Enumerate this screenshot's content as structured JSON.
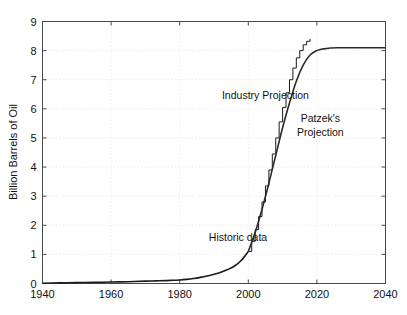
{
  "chart_data": {
    "type": "line",
    "title": "",
    "xlabel": "",
    "ylabel": "Billion Barrels of Oil",
    "xlim": [
      1940,
      2040
    ],
    "ylim": [
      0,
      9
    ],
    "xticks": [
      1940,
      1960,
      1980,
      2000,
      2020,
      2040
    ],
    "yticks": [
      0,
      1,
      2,
      3,
      4,
      5,
      6,
      7,
      8,
      9
    ],
    "grid": true,
    "grid_style": "dotted",
    "legend_position": "none",
    "annotations": [
      {
        "text": "Industry Projection",
        "x": 2005,
        "y": 6.35
      },
      {
        "text": "Patzek's",
        "x": 2021,
        "y": 5.55
      },
      {
        "text": "Projection",
        "x": 2021,
        "y": 5.05
      },
      {
        "text": "Historic data",
        "x": 1997,
        "y": 1.45
      }
    ],
    "series": [
      {
        "name": "Historic data",
        "style": "smooth",
        "color": "#1a1a1a",
        "width": 1.6,
        "x": [
          1940,
          1945,
          1950,
          1955,
          1960,
          1965,
          1970,
          1973,
          1976,
          1978,
          1980,
          1982,
          1984,
          1986,
          1988,
          1990,
          1992,
          1994,
          1996,
          1998,
          2000
        ],
        "values": [
          0.01,
          0.02,
          0.03,
          0.04,
          0.05,
          0.06,
          0.08,
          0.09,
          0.1,
          0.11,
          0.12,
          0.14,
          0.17,
          0.21,
          0.26,
          0.32,
          0.39,
          0.48,
          0.6,
          0.8,
          1.1
        ]
      },
      {
        "name": "Industry Projection",
        "style": "staircase",
        "color": "#1a1a1a",
        "width": 1.0,
        "x": [
          2000,
          2001,
          2002,
          2003,
          2004,
          2005,
          2006,
          2007,
          2008,
          2009,
          2010,
          2011,
          2012,
          2013,
          2014,
          2015,
          2016,
          2017,
          2018
        ],
        "values": [
          1.1,
          1.45,
          1.85,
          2.3,
          2.8,
          3.35,
          3.9,
          4.45,
          5.0,
          5.55,
          6.05,
          6.55,
          7.0,
          7.4,
          7.75,
          8.0,
          8.2,
          8.32,
          8.4
        ]
      },
      {
        "name": "Patzek's Projection",
        "style": "smooth",
        "color": "#2b2b2b",
        "width": 1.6,
        "x": [
          2000,
          2002,
          2004,
          2006,
          2008,
          2010,
          2012,
          2014,
          2016,
          2018,
          2020,
          2022,
          2024,
          2026,
          2028,
          2030,
          2032,
          2034,
          2036,
          2038,
          2040
        ],
        "values": [
          1.1,
          1.75,
          2.55,
          3.45,
          4.4,
          5.35,
          6.2,
          6.95,
          7.5,
          7.85,
          8.0,
          8.06,
          8.09,
          8.1,
          8.1,
          8.1,
          8.1,
          8.1,
          8.1,
          8.1,
          8.1
        ]
      }
    ]
  },
  "axes": {
    "y_title": "Billion Barrels of Oil",
    "x_tick_labels": [
      "1940",
      "1960",
      "1980",
      "2000",
      "2020",
      "2040"
    ],
    "y_tick_labels": [
      "0",
      "1",
      "2",
      "3",
      "4",
      "5",
      "6",
      "7",
      "8",
      "9"
    ]
  },
  "colors": {
    "axis": "#4a4a4a",
    "grid": "#dcdcdc",
    "historic": "#1a1a1a",
    "industry": "#1a1a1a",
    "patzek": "#2b2b2b",
    "background": "#ffffff"
  }
}
